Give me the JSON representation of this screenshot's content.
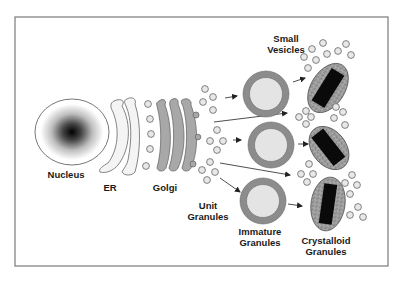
{
  "diagram": {
    "type": "cell-biology-pathway",
    "labels": {
      "nucleus": "Nucleus",
      "er": "ER",
      "golgi": "Golgi",
      "unit_granules_line1": "Unit",
      "unit_granules_line2": "Granules",
      "immature_granules_line1": "Immature",
      "immature_granules_line2": "Granules",
      "crystalloid_granules_line1": "Crystalloid",
      "crystalloid_granules_line2": "Granules",
      "small_vesicles_line1": "Small",
      "small_vesicles_line2": "Vesicles"
    },
    "colors": {
      "frame": "#7a7a7a",
      "outline": "#555555",
      "golgi_fill": "#a8a8a8",
      "granule_ring": "#8c8c8c",
      "granule_core": "#e4e4e4",
      "crystal_shell": "#9a9a9a",
      "crystal_core": "#0a0a0a",
      "vesicle_fill": "#e8e8e8"
    },
    "stages": [
      "Nucleus",
      "ER",
      "Golgi",
      "Unit Granules",
      "Immature Granules",
      "Crystalloid Granules",
      "Small Vesicles"
    ]
  }
}
